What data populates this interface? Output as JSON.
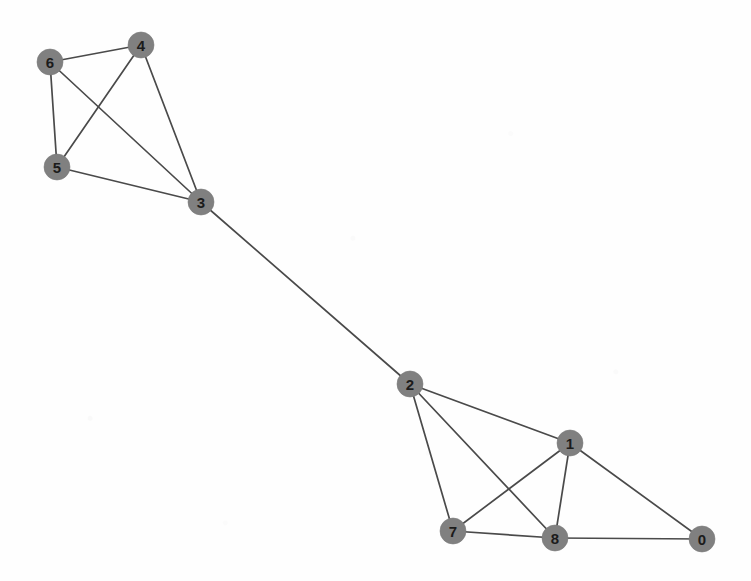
{
  "figure": {
    "kind": "network-graph",
    "width": 751,
    "height": 581,
    "background_color": "#ffffff"
  },
  "style": {
    "node_fill": "#808080",
    "node_radius": 13,
    "node_label_color": "#1b1b1b",
    "edge_color": "#4a4a4a",
    "edge_width": 1.7
  },
  "chart_data": {
    "type": "scatter",
    "title": "",
    "xlabel": "",
    "ylabel": "",
    "graph": {
      "directed": false,
      "node_count": 9,
      "edge_count": 15,
      "nodes": [
        {
          "id": "0",
          "label": "0",
          "x": 702,
          "y": 539,
          "degree": 2
        },
        {
          "id": "1",
          "label": "1",
          "x": 570,
          "y": 443,
          "degree": 4
        },
        {
          "id": "2",
          "label": "2",
          "x": 410,
          "y": 384,
          "degree": 4
        },
        {
          "id": "3",
          "label": "3",
          "x": 201,
          "y": 202,
          "degree": 4
        },
        {
          "id": "4",
          "label": "4",
          "x": 141,
          "y": 45,
          "degree": 3
        },
        {
          "id": "5",
          "label": "5",
          "x": 57,
          "y": 167,
          "degree": 3
        },
        {
          "id": "6",
          "label": "6",
          "x": 50,
          "y": 62,
          "degree": 3
        },
        {
          "id": "7",
          "label": "7",
          "x": 453,
          "y": 531,
          "degree": 3
        },
        {
          "id": "8",
          "label": "8",
          "x": 555,
          "y": 538,
          "degree": 4
        }
      ],
      "edges": [
        {
          "source": "6",
          "target": "4"
        },
        {
          "source": "6",
          "target": "5"
        },
        {
          "source": "6",
          "target": "3"
        },
        {
          "source": "4",
          "target": "5"
        },
        {
          "source": "4",
          "target": "3"
        },
        {
          "source": "5",
          "target": "3"
        },
        {
          "source": "3",
          "target": "2"
        },
        {
          "source": "2",
          "target": "1"
        },
        {
          "source": "2",
          "target": "7"
        },
        {
          "source": "2",
          "target": "8"
        },
        {
          "source": "1",
          "target": "7"
        },
        {
          "source": "1",
          "target": "8"
        },
        {
          "source": "1",
          "target": "0"
        },
        {
          "source": "7",
          "target": "8"
        },
        {
          "source": "8",
          "target": "0"
        }
      ]
    }
  }
}
